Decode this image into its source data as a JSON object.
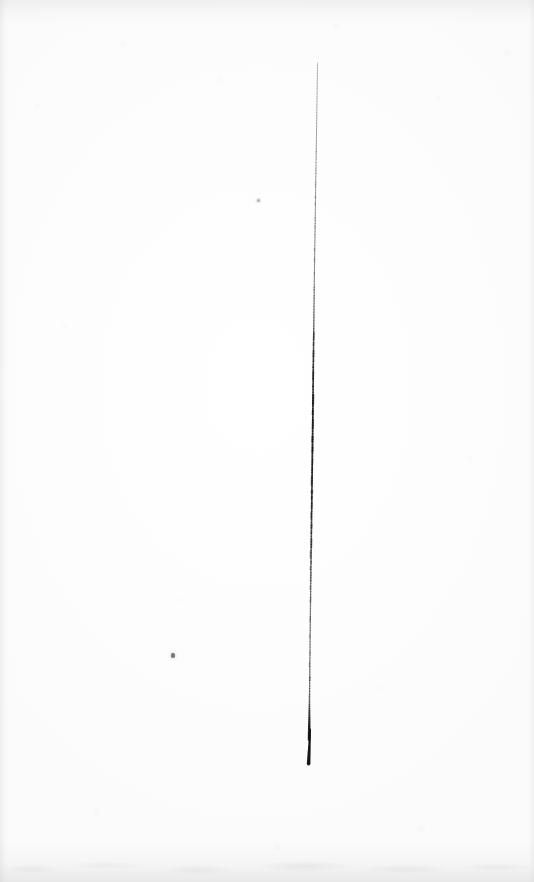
{
  "image": {
    "kind": "specimen-scan",
    "caption": "Thin elongated dark specimen on blank off-white paper background",
    "width_px": 534,
    "height_px": 882,
    "background_color": "#fdfdfd",
    "specimen_color": "#111111"
  },
  "chart_data": {
    "type": "line",
    "title": "",
    "xlabel": "",
    "ylabel": "",
    "xlim": [
      0,
      534
    ],
    "ylim": [
      0,
      882
    ],
    "grid": false,
    "legend": "none",
    "annotations": [],
    "series": [
      {
        "name": "specimen-shaft",
        "comment": "near-vertical dark stroke, top thin and pale, middle dark and irregular, bottom blunt thickened tip",
        "x": [
          317.5,
          317.0,
          316.4,
          315.8,
          315.2,
          314.6,
          314.1,
          313.6,
          313.2,
          312.8,
          312.3,
          311.8,
          311.3,
          310.8,
          310.3,
          309.9,
          309.5,
          309.2,
          309.0
        ],
        "y": [
          63,
          100,
          140,
          180,
          220,
          260,
          300,
          340,
          380,
          420,
          460,
          500,
          540,
          580,
          620,
          660,
          700,
          732,
          765
        ],
        "width_px": [
          0.9,
          0.9,
          1.0,
          1.0,
          1.1,
          1.1,
          1.2,
          1.4,
          1.6,
          1.7,
          1.7,
          1.6,
          1.5,
          1.3,
          1.2,
          1.2,
          1.4,
          2.6,
          3.4
        ],
        "opacity": [
          0.3,
          0.34,
          0.36,
          0.38,
          0.4,
          0.44,
          0.5,
          0.72,
          0.88,
          0.92,
          0.9,
          0.84,
          0.72,
          0.6,
          0.54,
          0.52,
          0.6,
          0.94,
          0.98
        ]
      }
    ],
    "features": [
      {
        "name": "top-end",
        "x": 317,
        "y": 63,
        "description": "faint tapered start of the stroke"
      },
      {
        "name": "dark-middle-band",
        "x": 314,
        "y": 440,
        "description": "darkest, most irregular dashed segment between y 340 and 560"
      },
      {
        "name": "blunt-tip",
        "x": 309,
        "y": 750,
        "description": "thickened solid black tip, ends bluntly"
      },
      {
        "name": "speck-upper",
        "x": 258,
        "y": 200,
        "description": "tiny pale grey speck"
      },
      {
        "name": "speck-lower",
        "x": 172,
        "y": 655,
        "description": "small dark speck"
      }
    ]
  },
  "markings": {
    "speck_upper_label": "upper stray speck",
    "speck_lower_label": "lower stray speck"
  }
}
